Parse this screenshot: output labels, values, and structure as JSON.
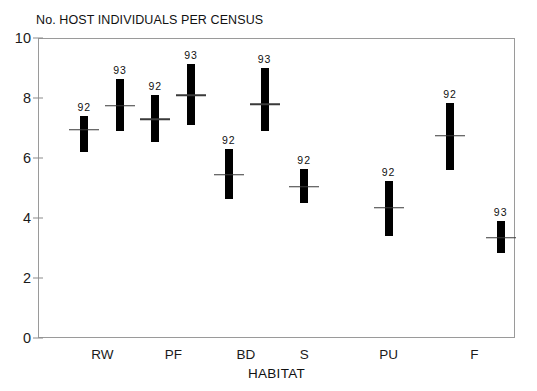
{
  "chart_data": {
    "type": "bar",
    "title": "No. HOST INDIVIDUALS PER CENSUS",
    "subtitle": "",
    "xlabel": "HABITAT",
    "ylabel": "",
    "categories": [
      "RW",
      "PF",
      "BD",
      "S",
      "PU",
      "F"
    ],
    "ylim": [
      0,
      10
    ],
    "yticks": [
      0,
      2,
      4,
      6,
      8,
      10
    ],
    "ytick_labels": [
      "0",
      "2",
      "4",
      "6",
      "8",
      "10"
    ],
    "grid": false,
    "legend": "none",
    "annotation_note": "Vertical bars show range (min-max); short horizontal tick shows the mean. Each bar is annotated above with its census year.",
    "series": [
      {
        "name": "92",
        "values": [
          6.95,
          7.3,
          5.45,
          5.05,
          4.35,
          6.75
        ],
        "low": [
          6.2,
          6.55,
          4.65,
          4.5,
          3.4,
          5.6
        ],
        "high": [
          7.4,
          8.1,
          6.3,
          5.65,
          5.25,
          7.85
        ]
      },
      {
        "name": "93",
        "values": [
          7.75,
          8.1,
          7.8,
          null,
          null,
          3.35
        ],
        "low": [
          6.9,
          7.1,
          6.9,
          null,
          null,
          2.85
        ],
        "high": [
          8.65,
          9.15,
          9.0,
          null,
          null,
          3.9
        ]
      }
    ],
    "bars": [
      {
        "category": "RW",
        "year_label": "92",
        "low": 6.2,
        "high": 7.4,
        "mean": 6.95,
        "x_pct": 9.7
      },
      {
        "category": "RW",
        "year_label": "93",
        "low": 6.9,
        "high": 8.65,
        "mean": 7.75,
        "x_pct": 17.2
      },
      {
        "category": "PF",
        "year_label": "92",
        "low": 6.55,
        "high": 8.1,
        "mean": 7.3,
        "x_pct": 24.6
      },
      {
        "category": "PF",
        "year_label": "93",
        "low": 7.1,
        "high": 9.15,
        "mean": 8.1,
        "x_pct": 32.1
      },
      {
        "category": "BD",
        "year_label": "92",
        "low": 4.65,
        "high": 6.3,
        "mean": 5.45,
        "x_pct": 40.0
      },
      {
        "category": "BD",
        "year_label": "93",
        "low": 6.9,
        "high": 9.0,
        "mean": 7.8,
        "x_pct": 47.5
      },
      {
        "category": "S",
        "year_label": "92",
        "low": 4.5,
        "high": 5.65,
        "mean": 5.05,
        "x_pct": 55.8
      },
      {
        "category": "PU",
        "year_label": "92",
        "low": 3.4,
        "high": 5.25,
        "mean": 4.35,
        "x_pct": 73.5
      },
      {
        "category": "F",
        "year_label": "92",
        "low": 5.6,
        "high": 7.85,
        "mean": 6.75,
        "x_pct": 86.4
      },
      {
        "category": "F",
        "year_label": "93",
        "low": 2.85,
        "high": 3.9,
        "mean": 3.35,
        "x_pct": 97.0
      }
    ],
    "category_x_pct": [
      13.5,
      28.4,
      43.6,
      55.8,
      73.5,
      91.5
    ]
  }
}
